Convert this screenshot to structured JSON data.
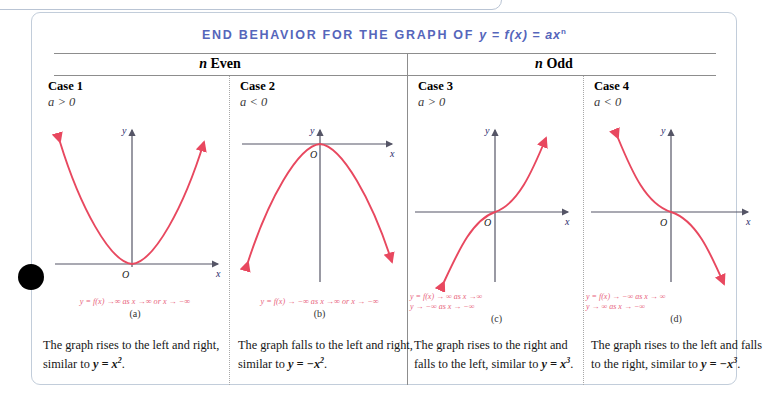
{
  "title": {
    "text_main": "END BEHAVIOR FOR THE GRAPH OF",
    "text_eq": "y = f(x) = ax",
    "exponent": "n",
    "color": "#5566bb"
  },
  "groups": [
    {
      "name": "n Even",
      "n": "n",
      "rest": " Even"
    },
    {
      "name": "n Odd",
      "n": "n",
      "rest": " Odd"
    }
  ],
  "cases": [
    {
      "title": "Case 1",
      "condition": "a > 0",
      "formula_line1": "y = f(x) →∞ as x →∞ or x → −∞",
      "formula_line2": "",
      "sublabel": "(a)",
      "description_pre": "The graph rises to the left and right, similar to ",
      "description_eq": "y = x",
      "description_sup": "2",
      "description_post": ".",
      "curve": "parabola-up"
    },
    {
      "title": "Case 2",
      "condition": "a < 0",
      "formula_line1": "y = f(x) → −∞ as x →∞ or x → −∞",
      "formula_line2": "",
      "sublabel": "(b)",
      "description_pre": "The graph falls to the left and right, similar to ",
      "description_eq": "y = −x",
      "description_sup": "2",
      "description_post": ".",
      "curve": "parabola-down"
    },
    {
      "title": "Case 3",
      "condition": "a > 0",
      "formula_line1": "y = f(x) → ∞ as x →∞",
      "formula_line2": "y → −∞ as x → −∞",
      "sublabel": "(c)",
      "description_pre": "The graph rises to the right and falls to the left, similar to ",
      "description_eq": "y = x",
      "description_sup": "3",
      "description_post": ".",
      "curve": "cubic-up"
    },
    {
      "title": "Case 4",
      "condition": "a < 0",
      "formula_line1": "y = f(x) → −∞ as x → ∞",
      "formula_line2": "y → ∞ as x → −∞",
      "sublabel": "(d)",
      "description_pre": "The graph rises to the left and falls to the right, similar to ",
      "description_eq": "y = −x",
      "description_sup": "3",
      "description_post": ".",
      "curve": "cubic-down"
    }
  ],
  "axis_labels": {
    "x": "x",
    "y": "y",
    "origin": "O"
  },
  "colors": {
    "curve": "#e8485f",
    "axis": "#555566",
    "title": "#5566bb",
    "formula": "#e8637c"
  },
  "cursor": {
    "shape": "filled-circle",
    "color": "#000000"
  }
}
